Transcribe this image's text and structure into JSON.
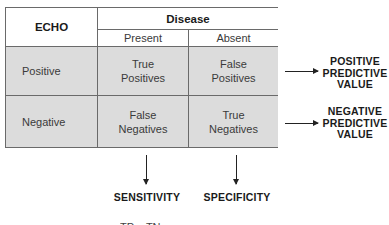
{
  "table": {
    "row_header_title": "ECHO",
    "column_group_title": "Disease",
    "columns": [
      "Present",
      "Absent"
    ],
    "rows": [
      {
        "label": "Positive",
        "cells": [
          "True\nPositives",
          "False\nPositives"
        ]
      },
      {
        "label": "Negative",
        "cells": [
          "False\nNegatives",
          "True\nNegatives"
        ]
      }
    ]
  },
  "outcomes": {
    "row_metrics": [
      {
        "line1": "POSITIVE",
        "line2": "PREDICTIVE",
        "line3": "VALUE"
      },
      {
        "line1": "NEGATIVE",
        "line2": "PREDICTIVE",
        "line3": "VALUE"
      }
    ],
    "column_metrics": [
      "SENSITIVITY",
      "SPECIFICITY"
    ]
  },
  "cutoff_text": "TP    TN",
  "colors": {
    "cell_gray": "#dcdcdc",
    "border": "#6a6a6a",
    "text": "#3a3a3a"
  }
}
